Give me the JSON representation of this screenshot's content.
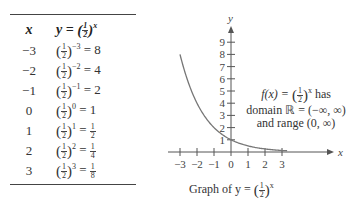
{
  "table": {
    "header": {
      "x": "x",
      "y_prefix": "y = ",
      "base_num": "1",
      "base_den": "2",
      "y_exp": "x"
    },
    "rows": [
      {
        "x": "−3",
        "exp": "−3",
        "result": "= 8"
      },
      {
        "x": "−2",
        "exp": "−2",
        "result": "= 4"
      },
      {
        "x": "−1",
        "exp": "−1",
        "result": "= 2"
      },
      {
        "x": "0",
        "exp": "0",
        "result": "= 1"
      },
      {
        "x": "1",
        "exp": "1",
        "result": "= ",
        "res_num": "1",
        "res_den": "2"
      },
      {
        "x": "2",
        "exp": "2",
        "result": "= ",
        "res_num": "1",
        "res_den": "4"
      },
      {
        "x": "3",
        "exp": "3",
        "result": "= ",
        "res_num": "1",
        "res_den": "8"
      }
    ]
  },
  "annotation": {
    "line1_prefix": "f(x) = ",
    "line1_suffix": " has",
    "line2": "domain ℝ = (−∞, ∞)",
    "line3": "and range (0, ∞)"
  },
  "caption": {
    "prefix": "Graph of y = ",
    "exp": "x"
  },
  "chart_data": {
    "type": "line",
    "xlabel": "x",
    "ylabel": "y",
    "x": [
      -3,
      -2,
      -1,
      0,
      1,
      2,
      3
    ],
    "series": [
      {
        "name": "y = (1/2)^x",
        "values": [
          8,
          4,
          2,
          1,
          0.5,
          0.25,
          0.125
        ]
      }
    ],
    "x_ticks": [
      "−3",
      "−2",
      "−1",
      "0",
      "1",
      "2",
      "3"
    ],
    "y_ticks": [
      "1",
      "2",
      "3",
      "4",
      "5",
      "6",
      "7",
      "8",
      "9"
    ],
    "xlim": [
      -3.2,
      3.5
    ],
    "ylim": [
      0,
      9.5
    ],
    "grid": false,
    "annotation": "f(x) = (1/2)^x has domain ℝ = (−∞, ∞) and range (0, ∞)"
  },
  "colors": {
    "curve": "#777777",
    "axis": "#555555",
    "text": "#333333"
  }
}
